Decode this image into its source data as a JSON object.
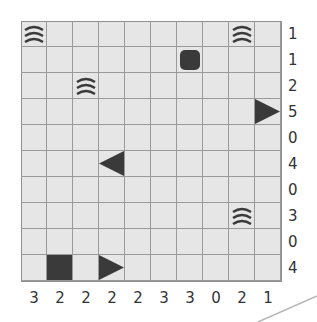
{
  "puzzle": {
    "type": "battleships",
    "size": 10,
    "row_clues": [
      "1",
      "1",
      "2",
      "5",
      "0",
      "4",
      "0",
      "3",
      "0",
      "4"
    ],
    "col_clues": [
      "3",
      "2",
      "2",
      "2",
      "2",
      "3",
      "3",
      "0",
      "2",
      "1"
    ],
    "given_cells": [
      {
        "row": 0,
        "col": 0,
        "kind": "water"
      },
      {
        "row": 0,
        "col": 8,
        "kind": "water"
      },
      {
        "row": 1,
        "col": 6,
        "kind": "submarine"
      },
      {
        "row": 2,
        "col": 2,
        "kind": "water"
      },
      {
        "row": 3,
        "col": 9,
        "kind": "end-right"
      },
      {
        "row": 5,
        "col": 3,
        "kind": "end-left"
      },
      {
        "row": 7,
        "col": 8,
        "kind": "water"
      },
      {
        "row": 9,
        "col": 1,
        "kind": "middle"
      },
      {
        "row": 9,
        "col": 3,
        "kind": "end-right"
      }
    ],
    "colors": {
      "cell_bg": "#e6e6e6",
      "grid_line": "#9a9a9a",
      "ship": "#3a3a3a",
      "clue_text": "#333333"
    }
  }
}
